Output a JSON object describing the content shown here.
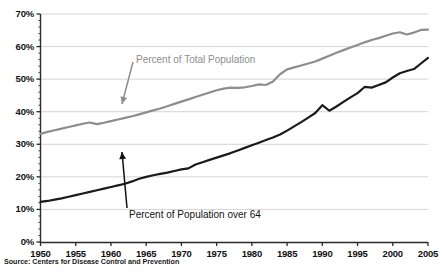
{
  "source_note": "Source: Centers for Disease Control and Prevention",
  "annotations": {
    "total_population": {
      "text": "Percent of Total Population",
      "color": "#8d8d8d",
      "arrow_from": [
        133,
        62
      ],
      "arrow_to": [
        122,
        104
      ]
    },
    "over_64": {
      "text": "Percent of Population over 64",
      "color": "#111111",
      "arrow_from": [
        127,
        208
      ],
      "arrow_to": [
        122,
        152
      ]
    }
  },
  "chart_data": {
    "type": "line",
    "title": "",
    "xlabel": "",
    "ylabel": "",
    "xlim": [
      1950,
      2005
    ],
    "ylim": [
      0,
      70
    ],
    "grid": true,
    "grid_axis": "y",
    "legend": "none",
    "y_tick_labels": [
      "0%",
      "10%",
      "20%",
      "30%",
      "40%",
      "50%",
      "60%",
      "70%"
    ],
    "y_ticks": [
      0,
      10,
      20,
      30,
      40,
      50,
      60,
      70
    ],
    "y_minor_ticks": true,
    "x_tick_labels": [
      "1950",
      "1955",
      "1960",
      "1965",
      "1970",
      "1975",
      "1980",
      "1985",
      "1990",
      "1995",
      "2000",
      "2005"
    ],
    "x_ticks": [
      1950,
      1955,
      1960,
      1965,
      1970,
      1975,
      1980,
      1985,
      1990,
      1995,
      2000,
      2005
    ],
    "series": [
      {
        "name": "Percent of Total Population",
        "color": "#8d8d8d",
        "width": 2.2,
        "x": [
          1950,
          1951,
          1952,
          1953,
          1954,
          1955,
          1956,
          1957,
          1958,
          1959,
          1960,
          1961,
          1962,
          1963,
          1964,
          1965,
          1966,
          1967,
          1968,
          1969,
          1970,
          1971,
          1972,
          1973,
          1974,
          1975,
          1976,
          1977,
          1978,
          1979,
          1980,
          1981,
          1982,
          1983,
          1984,
          1985,
          1986,
          1987,
          1988,
          1989,
          1990,
          1991,
          1992,
          1993,
          1994,
          1995,
          1996,
          1997,
          1998,
          1999,
          2000,
          2001,
          2002,
          2003,
          2004,
          2005
        ],
        "values": [
          33.2,
          33.8,
          34.3,
          34.8,
          35.3,
          35.8,
          36.3,
          36.7,
          36.2,
          36.6,
          37.1,
          37.6,
          38.1,
          38.6,
          39.2,
          39.8,
          40.4,
          41.0,
          41.7,
          42.4,
          43.1,
          43.8,
          44.5,
          45.2,
          45.9,
          46.6,
          47.1,
          47.4,
          47.3,
          47.5,
          47.9,
          48.4,
          48.2,
          49.3,
          51.5,
          53.0,
          53.6,
          54.2,
          54.8,
          55.4,
          56.3,
          57.2,
          58.1,
          58.9,
          59.7,
          60.5,
          61.3,
          62.0,
          62.6,
          63.3,
          64.0,
          64.4,
          63.7,
          64.3,
          65.1,
          65.2
        ]
      },
      {
        "name": "Percent of Population over 64",
        "color": "#1a1a1a",
        "width": 2.2,
        "x": [
          1950,
          1951,
          1952,
          1953,
          1954,
          1955,
          1956,
          1957,
          1958,
          1959,
          1960,
          1961,
          1962,
          1963,
          1964,
          1965,
          1966,
          1967,
          1968,
          1969,
          1970,
          1971,
          1972,
          1973,
          1974,
          1975,
          1976,
          1977,
          1978,
          1979,
          1980,
          1981,
          1982,
          1983,
          1984,
          1985,
          1986,
          1987,
          1988,
          1989,
          1990,
          1991,
          1992,
          1993,
          1994,
          1995,
          1996,
          1997,
          1998,
          1999,
          2000,
          2001,
          2002,
          2003,
          2004,
          2005
        ],
        "values": [
          12.3,
          12.6,
          13.0,
          13.4,
          13.9,
          14.4,
          14.9,
          15.4,
          15.9,
          16.4,
          16.9,
          17.4,
          17.9,
          18.6,
          19.4,
          20.0,
          20.5,
          20.9,
          21.3,
          21.8,
          22.3,
          22.6,
          23.8,
          24.5,
          25.2,
          25.9,
          26.6,
          27.3,
          28.1,
          28.9,
          29.7,
          30.5,
          31.3,
          32.1,
          33.0,
          34.2,
          35.5,
          36.8,
          38.2,
          39.6,
          42.0,
          40.3,
          41.6,
          43.0,
          44.4,
          45.7,
          47.6,
          47.4,
          48.2,
          49.0,
          50.5,
          51.8,
          52.5,
          53.1,
          54.8,
          56.5
        ]
      }
    ]
  }
}
